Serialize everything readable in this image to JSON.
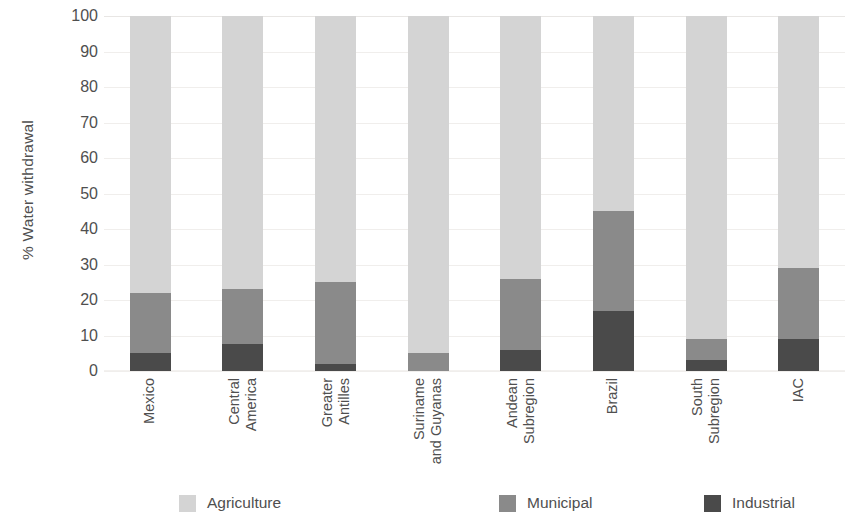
{
  "chart_data": {
    "type": "bar",
    "subtype": "stacked-bar-100-percent",
    "title": "",
    "xlabel": "",
    "ylabel": "% Water withdrawal",
    "ylim": [
      0,
      100
    ],
    "yticks": [
      0,
      10,
      20,
      30,
      40,
      50,
      60,
      70,
      80,
      90,
      100
    ],
    "ytick_labels": [
      "0",
      "10",
      "20",
      "30",
      "40",
      "50",
      "60",
      "70",
      "80",
      "90",
      "100"
    ],
    "grid": true,
    "legend_position": "bottom",
    "categories": [
      "Mexico",
      "Central America",
      "Greater Antilles",
      "Suriname and Guyanas",
      "Andean Subregion",
      "Brazil",
      "South Subregion",
      "IAC"
    ],
    "category_lines": [
      [
        "Mexico"
      ],
      [
        "Central",
        "America"
      ],
      [
        "Greater",
        "Antilles"
      ],
      [
        "Suriname",
        "and Guyanas"
      ],
      [
        "Andean",
        "Subregion"
      ],
      [
        "Brazil"
      ],
      [
        "South",
        "Subregion"
      ],
      [
        "IAC"
      ]
    ],
    "series": [
      {
        "name": "Agriculture",
        "color": "#d4d4d4",
        "values": [
          78,
          77,
          75,
          95,
          74,
          55,
          91,
          71
        ]
      },
      {
        "name": "Municipal",
        "color": "#8a8a8a",
        "values": [
          17,
          15.5,
          23,
          5,
          20,
          28,
          6,
          20
        ]
      },
      {
        "name": "Industrial",
        "color": "#4a4a4a",
        "values": [
          5,
          7.5,
          2,
          0,
          6,
          17,
          3,
          9
        ]
      }
    ],
    "stack_order_bottom_to_top": [
      "Industrial",
      "Municipal",
      "Agriculture"
    ]
  },
  "legend": {
    "items": [
      {
        "label": "Agriculture",
        "color": "#d4d4d4",
        "swatch": "sw-agriculture"
      },
      {
        "label": "Municipal",
        "color": "#8a8a8a",
        "swatch": "sw-municipal"
      },
      {
        "label": "Industrial",
        "color": "#4a4a4a",
        "swatch": "sw-industrial"
      }
    ]
  },
  "colors": {
    "agriculture": "#d4d4d4",
    "municipal": "#8a8a8a",
    "industrial": "#4a4a4a",
    "gridline": "#f0eeec",
    "text": "#4f4f4f",
    "background": "#ffffff"
  }
}
